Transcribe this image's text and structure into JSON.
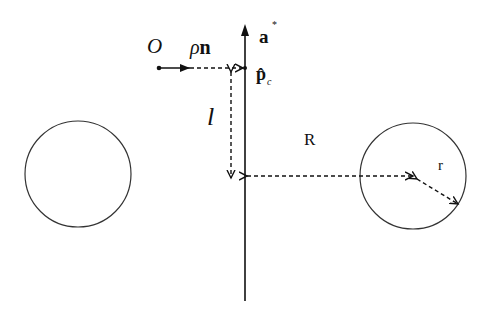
{
  "labels": {
    "origin": "O",
    "rho_n_rho": "ρ",
    "rho_n_n": "n",
    "axis_a": "a",
    "axis_a_sup": "*",
    "p_hat": "p̂",
    "p_sub": "c",
    "l": "l",
    "R": "R",
    "r": "r"
  },
  "colors": {
    "stroke": "#111111",
    "background": "#ffffff"
  },
  "geometry": {
    "axis_x": 245,
    "axis_top": 22,
    "axis_bottom": 301,
    "left_circle": {
      "cx": 78,
      "cy": 174,
      "r": 53
    },
    "right_circle": {
      "cx": 413,
      "cy": 176,
      "r": 53
    },
    "origin_point": {
      "x": 159,
      "y": 68
    },
    "pc_point": {
      "x": 245,
      "y": 68
    }
  }
}
